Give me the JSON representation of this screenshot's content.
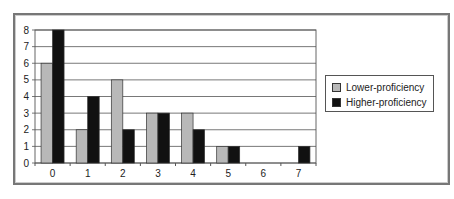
{
  "chart_data": {
    "type": "bar",
    "title": "",
    "xlabel": "",
    "ylabel": "",
    "categories": [
      "0",
      "1",
      "2",
      "3",
      "4",
      "5",
      "6",
      "7"
    ],
    "series": [
      {
        "name": "Lower-proficiency",
        "color": "#b8b8b8",
        "values": [
          6,
          2,
          5,
          3,
          3,
          1,
          0,
          0
        ]
      },
      {
        "name": "Higher-proficiency",
        "color": "#111111",
        "values": [
          8,
          4,
          2,
          3,
          2,
          1,
          0,
          1
        ]
      }
    ],
    "ylim": [
      0,
      8
    ],
    "yticks": [
      "0",
      "1",
      "2",
      "3",
      "4",
      "5",
      "6",
      "7",
      "8"
    ],
    "grid": true,
    "legend_position": "right"
  },
  "legend": {
    "items": [
      {
        "label": "Lower-proficiency",
        "color": "#b8b8b8"
      },
      {
        "label": "Higher-proficiency",
        "color": "#111111"
      }
    ]
  }
}
